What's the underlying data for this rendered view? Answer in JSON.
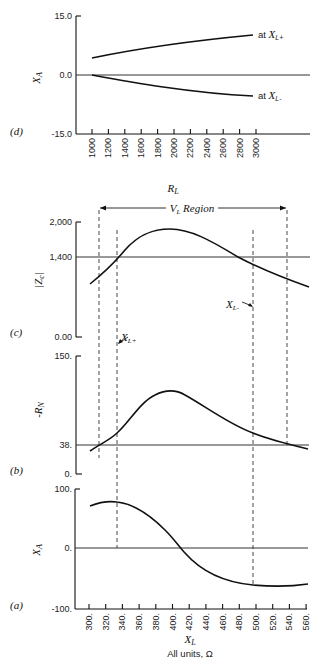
{
  "figure": {
    "footer_label": "All units, Ω",
    "panels": [
      "(d)",
      "(c)",
      "(b)",
      "(a)"
    ]
  },
  "chart_data": [
    {
      "panel": "(d)",
      "type": "line",
      "xlabel": "R_L",
      "ylabel": "X_A",
      "ylim": [
        -15.0,
        15.0
      ],
      "ytick_labels": [
        "15.0",
        "0.0",
        "-15.0"
      ],
      "x_ticks": [
        1000,
        1200,
        1400,
        1600,
        1800,
        2000,
        2200,
        2400,
        2600,
        2800,
        3000
      ],
      "reference_line_y": 0.0,
      "series": [
        {
          "name": "at X_L+",
          "x": [
            1000,
            1400,
            1800,
            2200,
            2600,
            3000
          ],
          "y": [
            4.3,
            6.0,
            7.5,
            8.7,
            9.6,
            10.3
          ]
        },
        {
          "name": "at X_L-",
          "x": [
            1000,
            1400,
            1800,
            2200,
            2600,
            3000
          ],
          "y": [
            0.0,
            -1.8,
            -3.4,
            -4.7,
            -5.5,
            -5.9
          ]
        }
      ]
    },
    {
      "panel": "(c)",
      "type": "line",
      "xlabel": "X_L",
      "ylabel": "|Z_c|",
      "ylim": [
        0,
        2000
      ],
      "ytick_labels": [
        "2,000",
        "1,400",
        "0.00"
      ],
      "reference_line_y": 1400,
      "annotations": [
        "V_L Region",
        "X_L-"
      ],
      "series": [
        {
          "name": "|Z_c|",
          "x": [
            300,
            320,
            340,
            360,
            380,
            400,
            420,
            440,
            460,
            480,
            500,
            520,
            540,
            560
          ],
          "y": [
            1180,
            1290,
            1450,
            1650,
            1780,
            1830,
            1800,
            1700,
            1570,
            1450,
            1360,
            1290,
            1240,
            1160
          ]
        }
      ]
    },
    {
      "panel": "(b)",
      "type": "line",
      "xlabel": "X_L",
      "ylabel": "-R_N",
      "ylim": [
        0,
        150
      ],
      "ytick_labels": [
        "150.",
        "38.",
        "0."
      ],
      "reference_line_y": 38,
      "annotations": [
        "X_L+"
      ],
      "series": [
        {
          "name": "-R_N",
          "x": [
            300,
            320,
            340,
            360,
            380,
            400,
            420,
            440,
            460,
            480,
            500,
            520,
            540,
            560
          ],
          "y": [
            33,
            43,
            60,
            90,
            110,
            113,
            104,
            88,
            72,
            60,
            50,
            42,
            37,
            34
          ]
        }
      ]
    },
    {
      "panel": "(a)",
      "type": "line",
      "xlabel": "X_L",
      "ylabel": "X_A",
      "ylim": [
        -100,
        100
      ],
      "ytick_labels": [
        "100.",
        "0.",
        "-100."
      ],
      "x_ticks": [
        300,
        320,
        340,
        360,
        380,
        400,
        420,
        440,
        460,
        480,
        500,
        520,
        540,
        560
      ],
      "reference_line_y": 0,
      "dashed_lines_x": [
        307,
        331,
        495,
        535
      ],
      "series": [
        {
          "name": "X_A",
          "x": [
            300,
            320,
            340,
            360,
            380,
            400,
            420,
            440,
            460,
            480,
            500,
            520,
            540,
            560
          ],
          "y": [
            72,
            78,
            76,
            62,
            40,
            15,
            -10,
            -25,
            -31,
            -33,
            -34,
            -34,
            -34,
            -33
          ]
        }
      ]
    }
  ]
}
